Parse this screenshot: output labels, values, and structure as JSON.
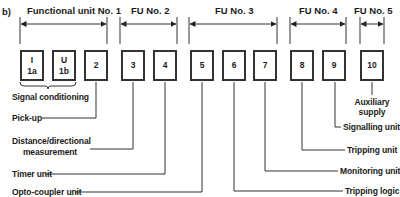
{
  "figure_label": "b)",
  "functional_units": [
    {
      "label": "Functional unit No. 1"
    },
    {
      "label": "FU No. 2"
    },
    {
      "label": "FU No. 3"
    },
    {
      "label": "FU No. 4"
    },
    {
      "label": "FU No. 5"
    }
  ],
  "boxes": [
    {
      "top": "I",
      "bottom": "1a"
    },
    {
      "top": "U",
      "bottom": "1b"
    },
    {
      "label": "2"
    },
    {
      "label": "3"
    },
    {
      "label": "4"
    },
    {
      "label": "5"
    },
    {
      "label": "6"
    },
    {
      "label": "7"
    },
    {
      "label": "8"
    },
    {
      "label": "9"
    },
    {
      "label": "10"
    }
  ],
  "left_labels": {
    "signal_conditioning": "Signal conditioning",
    "pick_up": "Pick-up",
    "distance_line1": "Distance/directional",
    "distance_line2": "measurement",
    "timer_unit": "Timer unit",
    "opto_coupler": "Opto-coupler unit"
  },
  "right_labels": {
    "auxiliary_line1": "Auxiliary",
    "auxiliary_line2": "supply",
    "signalling_unit": "Signalling unit",
    "tripping_unit": "Tripping unit",
    "monitoring_unit": "Monitoring unit",
    "tripping_logic": "Tripping logic"
  }
}
